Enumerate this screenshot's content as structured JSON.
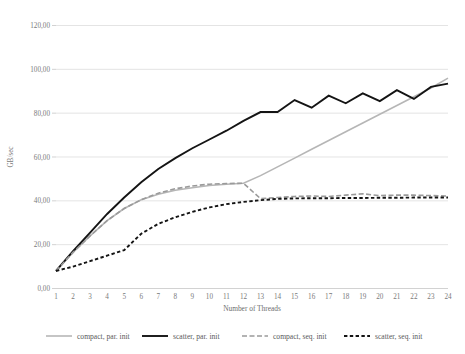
{
  "chart_data": {
    "type": "line",
    "title": "",
    "xlabel": "Number of Threads",
    "ylabel": "GB/sec",
    "xlim": [
      1,
      24
    ],
    "ylim": [
      0,
      120
    ],
    "grid": true,
    "legend_position": "bottom",
    "x": [
      1,
      2,
      3,
      4,
      5,
      6,
      7,
      8,
      9,
      10,
      11,
      12,
      13,
      14,
      15,
      16,
      17,
      18,
      19,
      20,
      21,
      22,
      23,
      24
    ],
    "xticklabels": [
      "1",
      "2",
      "3",
      "4",
      "5",
      "6",
      "7",
      "8",
      "9",
      "10",
      "11",
      "12",
      "13",
      "14",
      "15",
      "16",
      "17",
      "18",
      "19",
      "20",
      "21",
      "22",
      "23",
      "24"
    ],
    "yticks": [
      0,
      20,
      40,
      60,
      80,
      100,
      120
    ],
    "yticklabels": [
      "0,00",
      "20,00",
      "40,00",
      "60,00",
      "80,00",
      "100,00",
      "120,00"
    ],
    "series": [
      {
        "name": "compact, par. init",
        "color": "#b6b6b6",
        "width": 1.6,
        "dash": "none",
        "values": [
          8.0,
          16.5,
          24.0,
          31.0,
          36.5,
          40.5,
          43.0,
          44.8,
          46.0,
          47.0,
          47.6,
          48.0,
          51.5,
          55.5,
          59.5,
          63.5,
          67.5,
          71.5,
          75.5,
          79.5,
          83.5,
          87.5,
          91.5,
          96.0
        ]
      },
      {
        "name": "scatter, par. init",
        "color": "#141414",
        "width": 1.9,
        "dash": "none",
        "values": [
          8.0,
          17.0,
          25.5,
          34.0,
          41.5,
          48.5,
          54.5,
          59.5,
          64.0,
          68.0,
          72.0,
          76.5,
          80.5,
          80.5,
          86.0,
          82.5,
          88.0,
          84.5,
          89.0,
          85.5,
          90.5,
          86.5,
          92.0,
          93.5
        ]
      },
      {
        "name": "compact, seq. init",
        "color": "#9a9a9a",
        "width": 1.6,
        "dash": "5,2.5",
        "values": [
          8.0,
          16.5,
          24.0,
          31.0,
          36.5,
          40.5,
          43.5,
          45.5,
          46.8,
          47.6,
          47.9,
          48.0,
          41.0,
          41.5,
          42.0,
          42.2,
          42.0,
          42.6,
          43.2,
          42.4,
          42.6,
          42.6,
          42.4,
          42.2
        ]
      },
      {
        "name": "scatter, seq. init",
        "color": "#141414",
        "width": 1.9,
        "dash": "3.4,2.4",
        "values": [
          8.0,
          10.0,
          12.5,
          15.0,
          17.5,
          25.0,
          29.5,
          32.5,
          35.0,
          37.0,
          38.5,
          39.5,
          40.3,
          40.9,
          41.1,
          41.2,
          41.2,
          41.3,
          41.3,
          41.4,
          41.4,
          41.5,
          41.5,
          41.5
        ]
      }
    ]
  },
  "legend": {
    "items": [
      {
        "label": "compact, par. init"
      },
      {
        "label": "scatter, par. init"
      },
      {
        "label": "compact, seq. init"
      },
      {
        "label": "scatter, seq. init"
      }
    ]
  }
}
